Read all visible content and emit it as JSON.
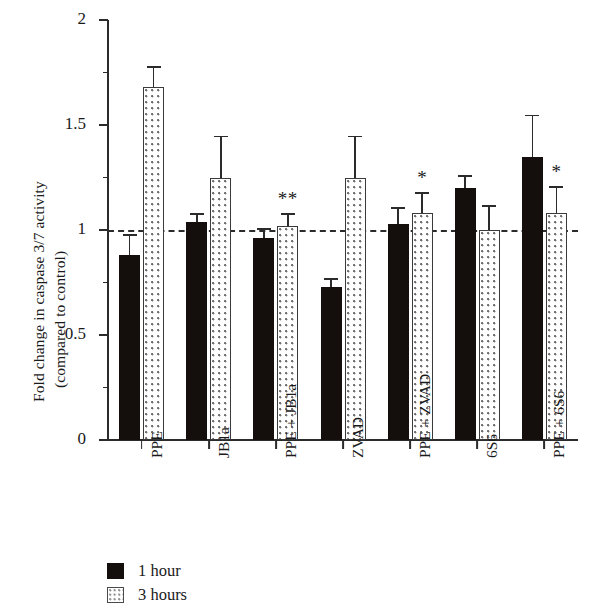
{
  "chart_data": {
    "type": "bar",
    "title": "",
    "xlabel": "",
    "ylabel_line1": "Fold change in caspase 3/7 activity",
    "ylabel_line2": "(compared to control)",
    "ylim": [
      0,
      2
    ],
    "ytick_labels": [
      "0",
      "0.5",
      "1",
      "1.5",
      "2"
    ],
    "ytick_values": [
      0,
      0.5,
      1,
      1.5,
      2
    ],
    "yminor_values": [
      0.25,
      0.75,
      1.25,
      1.75
    ],
    "grid": false,
    "reference_line": 1,
    "legend_position": "bottom-left",
    "categories": [
      "PPE",
      "JB1a",
      "PPE + JB1a",
      "ZVAD",
      "PPE + ZVAD",
      "6S6",
      "PPE + 6S6"
    ],
    "series": [
      {
        "name": "1 hour",
        "fill": "solid-black",
        "values": [
          0.88,
          1.04,
          0.96,
          0.73,
          1.03,
          1.2,
          1.35
        ],
        "errors": [
          0.1,
          0.04,
          0.05,
          0.04,
          0.08,
          0.06,
          0.2
        ],
        "annotations": [
          "",
          "",
          "",
          "",
          "",
          "",
          ""
        ]
      },
      {
        "name": "3 hours",
        "fill": "dotted",
        "values": [
          1.68,
          1.25,
          1.02,
          1.25,
          1.08,
          1.0,
          1.08
        ],
        "errors": [
          0.1,
          0.2,
          0.06,
          0.2,
          0.1,
          0.12,
          0.13
        ],
        "annotations": [
          "",
          "",
          "**",
          "",
          "*",
          "",
          "*"
        ]
      }
    ]
  },
  "legend": {
    "entries": [
      {
        "label": "1 hour",
        "fill": "solid-black"
      },
      {
        "label": "3 hours",
        "fill": "dotted"
      }
    ]
  }
}
